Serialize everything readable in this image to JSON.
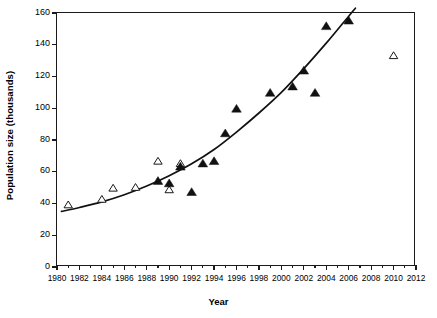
{
  "chart_data": {
    "type": "scatter",
    "title": "",
    "xlabel": "Year",
    "ylabel": "Population size (thousands)",
    "xlim": [
      1980,
      2012
    ],
    "ylim": [
      0,
      160
    ],
    "grid": false,
    "legend": "none",
    "x_major_ticks": [
      1980,
      1982,
      1984,
      1986,
      1988,
      1990,
      1992,
      1994,
      1996,
      1998,
      2000,
      2002,
      2004,
      2006,
      2008,
      2010,
      2012
    ],
    "x_minor_ticks": [
      1981,
      1983,
      1985,
      1987,
      1989,
      1991,
      1993,
      1995,
      1997,
      1999,
      2001,
      2003,
      2005,
      2007,
      2009,
      2011
    ],
    "x_tick_labels": [
      "1980",
      "1982",
      "1984",
      "1986",
      "1988",
      "1990",
      "1992",
      "1994",
      "1996",
      "1998",
      "2000",
      "2002",
      "2004",
      "2006",
      "2008",
      "2010",
      "2012"
    ],
    "y_ticks": [
      0,
      20,
      40,
      60,
      80,
      100,
      120,
      140,
      160
    ],
    "y_tick_labels": [
      "0",
      "20",
      "40",
      "60",
      "80",
      "100",
      "120",
      "140",
      "160"
    ],
    "series": [
      {
        "name": "open triangles",
        "marker": "triangle-open",
        "color": "#1a1a1a",
        "points": [
          {
            "x": 1981,
            "y": 39
          },
          {
            "x": 1984,
            "y": 42.5
          },
          {
            "x": 1985,
            "y": 49.5
          },
          {
            "x": 1987,
            "y": 50
          },
          {
            "x": 1989,
            "y": 66.5
          },
          {
            "x": 1990,
            "y": 48.5
          },
          {
            "x": 1991,
            "y": 65
          },
          {
            "x": 2010,
            "y": 133
          }
        ]
      },
      {
        "name": "filled triangles",
        "marker": "triangle-filled",
        "color": "#111111",
        "points": [
          {
            "x": 1989,
            "y": 54
          },
          {
            "x": 1990,
            "y": 52.5
          },
          {
            "x": 1991,
            "y": 63
          },
          {
            "x": 1992,
            "y": 47
          },
          {
            "x": 1993,
            "y": 65
          },
          {
            "x": 1994,
            "y": 66.5
          },
          {
            "x": 1995,
            "y": 84
          },
          {
            "x": 1996,
            "y": 99.5
          },
          {
            "x": 1999,
            "y": 109.5
          },
          {
            "x": 2001,
            "y": 113.5
          },
          {
            "x": 2002,
            "y": 123.5
          },
          {
            "x": 2003,
            "y": 109.5
          },
          {
            "x": 2004,
            "y": 151.5
          },
          {
            "x": 2006,
            "y": 155
          }
        ]
      }
    ],
    "fitted_curve": {
      "name": "exponential trend line",
      "color": "#111111",
      "points": [
        {
          "x": 1980.4,
          "y": 35
        },
        {
          "x": 1982,
          "y": 37.5
        },
        {
          "x": 1984,
          "y": 41
        },
        {
          "x": 1986,
          "y": 45.5
        },
        {
          "x": 1988,
          "y": 51
        },
        {
          "x": 1990,
          "y": 57.5
        },
        {
          "x": 1992,
          "y": 65
        },
        {
          "x": 1994,
          "y": 74
        },
        {
          "x": 1996,
          "y": 85
        },
        {
          "x": 1998,
          "y": 97
        },
        {
          "x": 2000,
          "y": 110
        },
        {
          "x": 2002,
          "y": 125
        },
        {
          "x": 2004,
          "y": 141
        },
        {
          "x": 2006,
          "y": 158
        },
        {
          "x": 2006.6,
          "y": 163
        }
      ]
    }
  }
}
